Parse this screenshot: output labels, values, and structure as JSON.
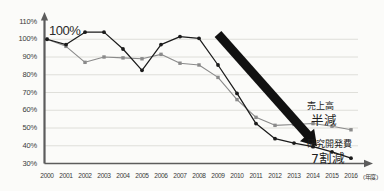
{
  "chart_data": {
    "type": "line",
    "title": "",
    "subtitle": "",
    "xlabel": "(年度)",
    "ylabel": "",
    "x": [
      "2000",
      "2001",
      "2002",
      "2003",
      "2004",
      "2005",
      "2006",
      "2007",
      "2008",
      "2009",
      "2010",
      "2011",
      "2012",
      "2013",
      "2014",
      "2015",
      "2016"
    ],
    "ylim": [
      30,
      110
    ],
    "ytick_values": [
      30,
      40,
      50,
      60,
      70,
      80,
      90,
      100,
      110
    ],
    "ytick_labels": [
      "30%",
      "40%",
      "50%",
      "60%",
      "70%",
      "80%",
      "90%",
      "100%",
      "110%"
    ],
    "grid": true,
    "legend_position": "right-inline",
    "series": [
      {
        "name": "売上高",
        "key": "sales",
        "color": "#8a8a8a",
        "marker": "square",
        "values": [
          100,
          96,
          87,
          90,
          89.5,
          89,
          91.5,
          86.5,
          85.5,
          78.5,
          66,
          56,
          51.5,
          52,
          52.5,
          51,
          49
        ]
      },
      {
        "name": "研究開発費",
        "key": "rd",
        "color": "#1b1b1b",
        "marker": "circle",
        "values": [
          100,
          97,
          104,
          104,
          94.5,
          82.5,
          97,
          101.5,
          100.5,
          85.5,
          69.5,
          52.5,
          44,
          41.5,
          39.5,
          36.5,
          33
        ]
      }
    ],
    "annotations": [
      {
        "name": "baseline-100-label",
        "text": "100%"
      },
      {
        "name": "sales-series-label",
        "text": "売上高"
      },
      {
        "name": "sales-change-label",
        "text": "半減"
      },
      {
        "name": "rd-series-label",
        "text": "研究開発費"
      },
      {
        "name": "rd-change-label",
        "text": "7割減"
      }
    ],
    "arrow": {
      "name": "decline-arrow",
      "description": "thick black downward-right arrow",
      "color": "#111111",
      "from": {
        "year": "2009",
        "value": 103
      },
      "to": {
        "year": "2014",
        "value": 42
      }
    }
  },
  "colors": {
    "background": "#fbfbf9",
    "grid": "#d8d8d2",
    "axis": "#5c5c5c",
    "sales_line": "#8a8a8a",
    "rd_line": "#1b1b1b",
    "arrow": "#111111",
    "text": "#2b2b2b"
  }
}
